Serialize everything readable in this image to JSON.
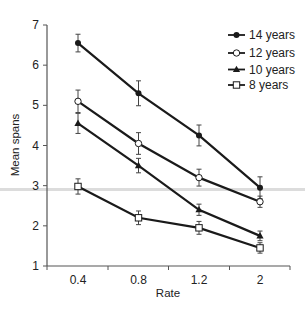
{
  "chart_data": {
    "type": "line",
    "title": "",
    "xlabel": "Rate",
    "ylabel": "Mean spans",
    "categories": [
      "0.4",
      "0.8",
      "1.2",
      "2"
    ],
    "ylim": [
      1,
      7
    ],
    "yticks": [
      "1",
      "2",
      "3",
      "4",
      "5",
      "6",
      "7"
    ],
    "grid": false,
    "legend": "top-right",
    "error_bars": true,
    "series": [
      {
        "name": "14 years",
        "marker": "filled-diamond",
        "values": [
          6.55,
          5.3,
          4.25,
          2.95
        ],
        "errors": [
          0.22,
          0.31,
          0.26,
          0.27
        ]
      },
      {
        "name": "12 years",
        "marker": "open-circle",
        "values": [
          5.1,
          4.05,
          3.2,
          2.6
        ],
        "errors": [
          0.28,
          0.27,
          0.21,
          0.14
        ]
      },
      {
        "name": "10 years",
        "marker": "filled-triangle",
        "values": [
          4.55,
          3.5,
          2.4,
          1.75
        ],
        "errors": [
          0.25,
          0.18,
          0.14,
          0.12
        ]
      },
      {
        "name": "8 years",
        "marker": "open-square",
        "values": [
          2.98,
          2.2,
          1.95,
          1.45
        ],
        "errors": [
          0.19,
          0.17,
          0.16,
          0.13
        ]
      }
    ]
  },
  "colors": {
    "line": "#1a1a1a",
    "axis": "#555555",
    "band": "#d8d8d8"
  }
}
